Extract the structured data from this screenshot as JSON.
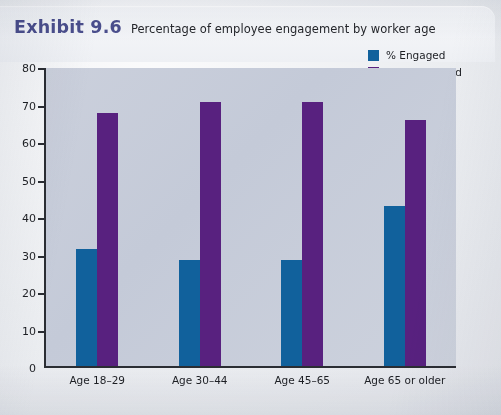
{
  "exhibit": {
    "label": "Exhibit 9.6",
    "subtitle": "Percentage of employee engagement by worker age",
    "label_color": "#4b4f8e"
  },
  "legend": {
    "position": "top-right",
    "items": [
      {
        "label": "% Engaged",
        "color": "#11619c",
        "swatch": "square-swatch"
      },
      {
        "label": "% Disengaged",
        "color": "#58217f",
        "swatch": "square-swatch"
      }
    ]
  },
  "axis": {
    "y_ticks": [
      "80",
      "70",
      "60",
      "50",
      "40",
      "30",
      "20",
      "10",
      "0"
    ],
    "y_min": 0,
    "y_max": 80,
    "y_step": 10
  },
  "chart_data": {
    "type": "bar",
    "title": "Percentage of employee engagement by worker age",
    "subtitle": "Exhibit 9.6",
    "categories": [
      "Age 18–29",
      "Age 30–44",
      "Age 45–65",
      "Age 65 or older"
    ],
    "series": [
      {
        "name": "% Engaged",
        "color": "#11619c",
        "values": [
          31.5,
          28.5,
          28.5,
          43
        ]
      },
      {
        "name": "% Disengaged",
        "color": "#58217f",
        "values": [
          68,
          71,
          71,
          66
        ]
      }
    ],
    "xlabel": "",
    "ylabel": "",
    "ylim": [
      0,
      80
    ],
    "ytick_step": 10,
    "grid": false,
    "legend_position": "top-right"
  }
}
